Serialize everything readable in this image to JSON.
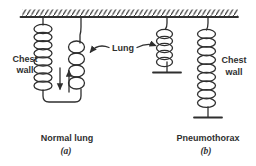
{
  "figure": {
    "labels": {
      "chest_wall_left_line1": "Chest",
      "chest_wall_left_line2": "wall",
      "lung": "Lung",
      "chest_wall_right_line1": "Chest",
      "chest_wall_right_line2": "wall"
    },
    "captions": {
      "a_title": "Normal lung",
      "a_tag": "(a)",
      "b_title": "Pneumothorax",
      "b_tag": "(b)"
    },
    "colors": {
      "ink": "#2f2f2f",
      "background": "#ffffff"
    }
  }
}
